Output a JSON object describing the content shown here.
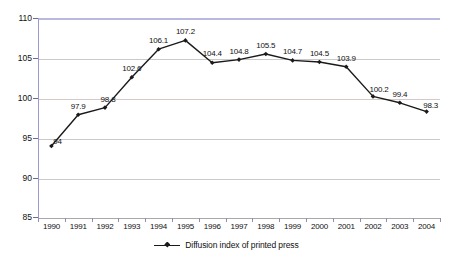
{
  "chart_data": {
    "type": "line",
    "title": "",
    "subtitle": "",
    "xlabel": "",
    "ylabel": "",
    "categories": [
      "1990",
      "1991",
      "1992",
      "1993",
      "1994",
      "1995",
      "1996",
      "1997",
      "1998",
      "1999",
      "2000",
      "2001",
      "2002",
      "2003",
      "2004"
    ],
    "values": [
      94,
      97.9,
      98.8,
      102.6,
      106.1,
      107.2,
      104.4,
      104.8,
      105.5,
      104.7,
      104.5,
      103.9,
      100.2,
      99.4,
      98.3
    ],
    "point_labels": [
      "94",
      "97.9",
      "98.8",
      "102.6",
      "106.1",
      "107.2",
      "104.4",
      "104.8",
      "105.5",
      "104.7",
      "104.5",
      "103.9",
      "100.2",
      "99.4",
      "98.3"
    ],
    "series": [
      {
        "name": "Diffusion index of printed press",
        "values": [
          94,
          97.9,
          98.8,
          102.6,
          106.1,
          107.2,
          104.4,
          104.8,
          105.5,
          104.7,
          104.5,
          103.9,
          100.2,
          99.4,
          98.3
        ],
        "color": "#1a1a1a",
        "marker": "diamond"
      }
    ],
    "ylim": [
      85,
      110
    ],
    "yticks": [
      85,
      90,
      95,
      100,
      105,
      110
    ],
    "ytick_labels": [
      "85",
      "90",
      "95",
      "100",
      "105",
      "110"
    ],
    "grid": true,
    "grid_color": "#c9c9c9",
    "legend": {
      "position": "bottom-center",
      "entries": [
        "Diffusion index of printed press"
      ]
    },
    "plot_border_color": "#9a9ad2",
    "background": "#ffffff"
  },
  "legend": {
    "label": "Diffusion index of printed press"
  }
}
